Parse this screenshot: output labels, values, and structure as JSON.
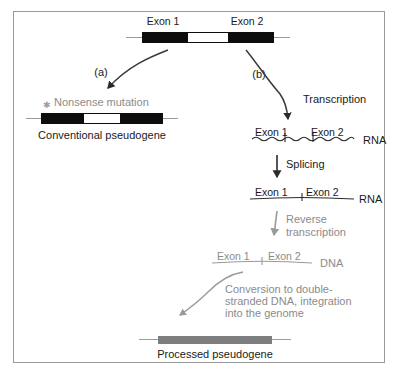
{
  "figure": {
    "title_present": false,
    "colors": {
      "exon_fill": "#0d0d0d",
      "intron_fill": "#ffffff",
      "flank_line": "#9b9b9b",
      "text_black": "#1a1a1a",
      "text_gray": "#8b8b8b",
      "processed_bar": "#7e7e7e",
      "frame_border": "#9a9a9a",
      "background": "#ffffff"
    }
  },
  "top_gene": {
    "exon1_label": "Exon 1",
    "exon2_label": "Exon 2"
  },
  "branches": {
    "a_label": "(a)",
    "b_label": "(b)"
  },
  "left_branch": {
    "mutation_marker": "star-icon",
    "mutation_label": "Nonsense mutation",
    "product_label": "Conventional pseudogene",
    "exon1_label": "Exon 1",
    "exon2_label": "Exon 2"
  },
  "right_branch": {
    "transcription_label": "Transcription",
    "splicing_label": "Splicing",
    "reverse_transcription_label_line1": "Reverse",
    "reverse_transcription_label_line2": "transcription",
    "conversion_label_line1": "Conversion to double-",
    "conversion_label_line2": "stranded DNA, integration",
    "conversion_label_line3": "into the genome",
    "unspliced_rna": {
      "exon1_label": "Exon 1",
      "exon2_label": "Exon 2",
      "molecule_tag": "RNA",
      "line_style": "wavy"
    },
    "spliced_rna": {
      "exon1_label": "Exon 1",
      "exon2_label": "Exon 2",
      "molecule_tag": "RNA",
      "line_style": "straight"
    },
    "cdna": {
      "exon1_label": "Exon 1",
      "exon2_label": "Exon 2",
      "molecule_tag": "DNA",
      "line_style": "straight-gray"
    },
    "product_label": "Processed pseudogene"
  }
}
